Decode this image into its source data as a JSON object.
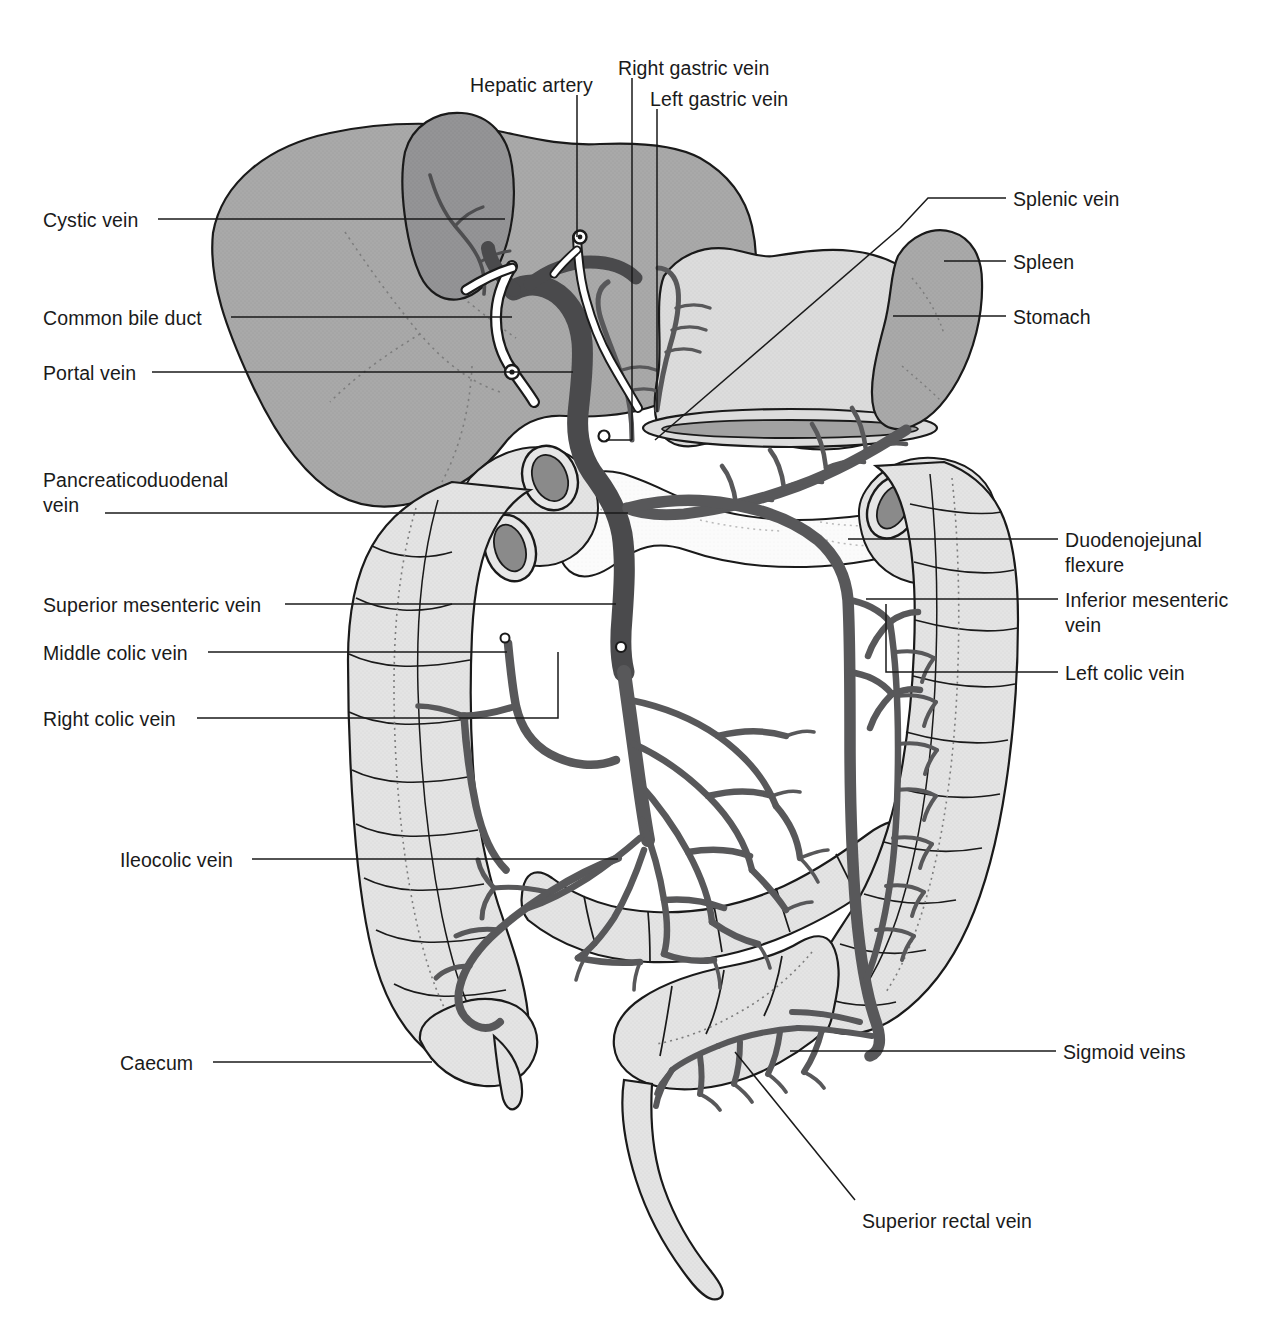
{
  "figure": {
    "type": "anatomical-line-diagram",
    "background": "#ffffff",
    "palette": {
      "outline": "#1a1a1a",
      "vein_dark": "#58585a",
      "vein_portal": "#4a4a4c",
      "liver_fill": "#a9a9a9",
      "gallbladder_fill": "#8f8f8f",
      "stomach_fill": "#d8d8d8",
      "spleen_fill": "#a9a9a9",
      "bowel_fill": "#e3e3e3",
      "pancreas_fill": "#fbfbfb",
      "lumen_fill": "#8a8a8a",
      "duct_fill": "#ffffff",
      "leader_line": "#1a1a1a"
    }
  },
  "labels_left": [
    {
      "id": "cystic-vein",
      "text": "Cystic vein",
      "x": 43,
      "y": 208,
      "leader_x1": 158,
      "leader_y1": 219,
      "leader_x2": 505,
      "leader_y2": 219
    },
    {
      "id": "common-bile-duct",
      "text": "Common bile duct",
      "x": 43,
      "y": 306,
      "leader_x1": 231,
      "leader_y1": 317,
      "leader_x2": 512,
      "leader_y2": 317
    },
    {
      "id": "portal-vein",
      "text": "Portal vein",
      "x": 43,
      "y": 361,
      "leader_x1": 152,
      "leader_y1": 372,
      "leader_x2": 573,
      "leader_y2": 372
    },
    {
      "id": "pancreaticoduodenal-vein",
      "text": "Pancreaticoduodenal\nvein",
      "x": 43,
      "y": 468,
      "leader_x1": 105,
      "leader_y1": 513,
      "leader_x2": 628,
      "leader_y2": 513
    },
    {
      "id": "superior-mesenteric-vein",
      "text": "Superior mesenteric vein",
      "x": 43,
      "y": 593,
      "leader_x1": 285,
      "leader_y1": 604,
      "leader_x2": 616,
      "leader_y2": 604
    },
    {
      "id": "middle-colic-vein",
      "text": "Middle colic vein",
      "x": 43,
      "y": 641,
      "leader_x1": 208,
      "leader_y1": 652,
      "leader_x2": 507,
      "leader_y2": 652
    },
    {
      "id": "right-colic-vein",
      "text": "Right colic vein",
      "x": 43,
      "y": 707,
      "leader_x1": 197,
      "leader_y1": 718,
      "leader_x2": 558,
      "leader_y2": 718
    },
    {
      "id": "ileocolic-vein",
      "text": "Ileocolic vein",
      "x": 120,
      "y": 848,
      "leader_x1": 252,
      "leader_y1": 859,
      "leader_x2": 618,
      "leader_y2": 859
    },
    {
      "id": "caecum",
      "text": "Caecum",
      "x": 120,
      "y": 1051,
      "leader_x1": 213,
      "leader_y1": 1062,
      "leader_x2": 432,
      "leader_y2": 1062
    }
  ],
  "labels_right": [
    {
      "id": "splenic-vein",
      "text": "Splenic vein",
      "x": 1013,
      "y": 187,
      "leader_x1": 1006,
      "leader_y1": 198,
      "leader_x2": 928,
      "leader_y2": 198
    },
    {
      "id": "spleen",
      "text": "Spleen",
      "x": 1013,
      "y": 250,
      "leader_x1": 1006,
      "leader_y1": 261,
      "leader_x2": 944,
      "leader_y2": 261
    },
    {
      "id": "stomach",
      "text": "Stomach",
      "x": 1013,
      "y": 305,
      "leader_x1": 1006,
      "leader_y1": 316,
      "leader_x2": 893,
      "leader_y2": 316
    },
    {
      "id": "duodenojejunal-flexure",
      "text": "Duodenojejunal\nflexure",
      "x": 1065,
      "y": 528,
      "leader_x1": 1058,
      "leader_y1": 539,
      "leader_x2": 848,
      "leader_y2": 539
    },
    {
      "id": "inferior-mesenteric-vein",
      "text": "Inferior mesenteric\nvein",
      "x": 1065,
      "y": 588,
      "leader_x1": 1058,
      "leader_y1": 599,
      "leader_x2": 866,
      "leader_y2": 599
    },
    {
      "id": "left-colic-vein",
      "text": "Left colic vein",
      "x": 1065,
      "y": 661,
      "leader_x1": 1058,
      "leader_y1": 672,
      "leader_x2": 886,
      "leader_y2": 672
    },
    {
      "id": "sigmoid-veins",
      "text": "Sigmoid veins",
      "x": 1063,
      "y": 1040,
      "leader_x1": 1056,
      "leader_y1": 1051,
      "leader_x2": 790,
      "leader_y2": 1051
    }
  ],
  "labels_top": [
    {
      "id": "hepatic-artery",
      "text": "Hepatic artery",
      "x": 470,
      "y": 73,
      "leader_x1": 577,
      "leader_y1": 95,
      "leader_x2": 577,
      "leader_y2": 237
    },
    {
      "id": "right-gastric-vein",
      "text": "Right gastric vein",
      "x": 618,
      "y": 56,
      "leader_x1": 632,
      "leader_y1": 78,
      "leader_x2": 632,
      "leader_y2": 440
    },
    {
      "id": "left-gastric-vein",
      "text": "Left gastric vein",
      "x": 650,
      "y": 87,
      "leader_x1": 657,
      "leader_y1": 109,
      "leader_x2": 657,
      "leader_y2": 410
    }
  ],
  "labels_bottom": [
    {
      "id": "superior-rectal-vein",
      "text": "Superior rectal vein",
      "x": 862,
      "y": 1209,
      "leader_x1": 855,
      "leader_y1": 1205,
      "leader_x2": 735,
      "leader_y2": 1052
    }
  ],
  "structures": [
    {
      "name": "liver",
      "shade": "mid-gray"
    },
    {
      "name": "gallbladder",
      "shade": "dark-gray"
    },
    {
      "name": "stomach",
      "shade": "light-gray"
    },
    {
      "name": "spleen",
      "shade": "mid-gray"
    },
    {
      "name": "pancreas",
      "shade": "white-stippled"
    },
    {
      "name": "duodenum",
      "shade": "light-gray"
    },
    {
      "name": "ascending-colon",
      "shade": "light-gray"
    },
    {
      "name": "transverse-colon",
      "shade": "light-gray"
    },
    {
      "name": "descending-colon",
      "shade": "light-gray"
    },
    {
      "name": "sigmoid-colon",
      "shade": "light-gray"
    },
    {
      "name": "caecum-appendix",
      "shade": "light-gray"
    },
    {
      "name": "small-bowel-mesentery",
      "shade": "light-gray"
    },
    {
      "name": "portal-vein-trunk",
      "shade": "dark-gray"
    },
    {
      "name": "superior-mesenteric-vein-trunk",
      "shade": "dark-gray"
    },
    {
      "name": "inferior-mesenteric-vein-trunk",
      "shade": "dark-gray"
    },
    {
      "name": "splenic-vein-trunk",
      "shade": "dark-gray"
    },
    {
      "name": "jejunal-ileal-arcades",
      "shade": "dark-gray"
    },
    {
      "name": "common-bile-duct-tube",
      "shade": "white"
    },
    {
      "name": "hepatic-artery-tube",
      "shade": "white"
    }
  ]
}
